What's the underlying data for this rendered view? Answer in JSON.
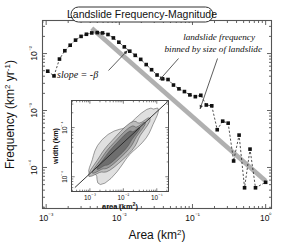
{
  "figure": {
    "title": "Landslide Frequency-Magnitude",
    "background": "#ffffff",
    "marker_color": "#111111",
    "trend_color": "#b0b0b0",
    "axis_color": "#555555"
  },
  "annotations": {
    "slope": "slope = -β",
    "binned_line1": "landslide frequency",
    "binned_line2": "binned by size of landslide"
  },
  "axes": {
    "x": {
      "label": "Area (km²)",
      "ticks": [
        "10⁻³",
        "10⁻²",
        "10⁻¹",
        "10⁰"
      ],
      "tick_values": [
        -3,
        -2,
        -1,
        0
      ],
      "range": [
        -3.05,
        0.08
      ]
    },
    "y": {
      "label": "Frequency (km² yr⁻¹)",
      "ticks": [
        "10⁻²",
        "10⁻³",
        "10⁻⁴"
      ],
      "tick_values": [
        -2,
        -3,
        -4
      ],
      "range": [
        -4.72,
        -1.42
      ]
    }
  },
  "inset": {
    "x": {
      "label": "area (km²)",
      "ticks": [
        "10⁻³",
        "10⁻²",
        "10⁻¹"
      ],
      "tick_values": [
        -3,
        -2,
        -1
      ],
      "range": [
        -3.55,
        -0.65
      ]
    },
    "y": {
      "label": "width (km)",
      "ticks": [
        "10⁻⁴",
        "10⁻⁵"
      ],
      "tick_values": [
        -4,
        -5
      ],
      "range": [
        -5.3,
        -3.45
      ]
    }
  },
  "chart_data": {
    "type": "scatter",
    "title": "Landslide Frequency-Magnitude",
    "xlabel": "Area (km²)",
    "ylabel": "Frequency (km² yr⁻¹)",
    "xscale": "log",
    "yscale": "log",
    "xlim": [
      0.001,
      1.0
    ],
    "ylim": [
      1.9e-05,
      0.038
    ],
    "grid": false,
    "legend": null,
    "series": [
      {
        "name": "landslide frequency binned by size of landslide",
        "marker": "square",
        "line": "dashed",
        "x": [
          0.00105,
          0.00128,
          0.00152,
          0.0018,
          0.00213,
          0.00252,
          0.003,
          0.00355,
          0.0042,
          0.005,
          0.0059,
          0.007,
          0.0083,
          0.00985,
          0.0117,
          0.0139,
          0.0165,
          0.0196,
          0.0233,
          0.0276,
          0.0328,
          0.039,
          0.0463,
          0.055,
          0.0653,
          0.0776,
          0.0921,
          0.1094,
          0.13,
          0.1544,
          0.1834,
          0.2178,
          0.2587,
          0.3073,
          0.365,
          0.4335,
          0.5149,
          0.6116,
          0.7265,
          1.0
        ],
        "y": [
          0.0049,
          0.00405,
          0.008,
          0.0112,
          0.014,
          0.0172,
          0.02,
          0.0218,
          0.023,
          0.0233,
          0.023,
          0.0216,
          0.0188,
          0.0158,
          0.0131,
          0.011,
          0.0093,
          0.0079,
          0.0064,
          0.0052,
          0.0042,
          0.0036,
          0.0035,
          0.0028,
          0.0024,
          0.00215,
          0.00188,
          0.00175,
          0.00185,
          0.00125,
          0.00121,
          0.00046,
          0.00065,
          0.0006,
          0.00013,
          0.00037,
          4.4e-05,
          0.00021,
          4.4e-05,
          5.5e-05
        ]
      },
      {
        "name": "power-law fit (slope = -β)",
        "marker": "none",
        "line": "solid-thick-gray",
        "x": [
          0.0042,
          1.0
        ],
        "y": [
          0.0277,
          5.8e-05
        ]
      }
    ]
  },
  "inset_chart_data": {
    "type": "contour",
    "xlabel": "area (km²)",
    "ylabel": "width (km)",
    "xscale": "log",
    "yscale": "log",
    "xlim": [
      0.00028,
      0.22
    ],
    "ylim": [
      5e-06,
      0.00035
    ],
    "levels": 4,
    "level_fills": [
      "#e0e0e0",
      "#bdbdbd",
      "#9a9a9a",
      "#6e6e6e"
    ],
    "regression_line": true
  }
}
